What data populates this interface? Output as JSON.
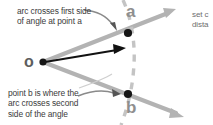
{
  "figure": {
    "vertex_label": "o",
    "point_a_label": "a",
    "point_b_label": "b",
    "callout_a": "arc crosses first side\nof angle at point a",
    "callout_b": "point b is where the\narc crosses second\nside of the angle",
    "callout_right": "set c\ndista"
  },
  "colors": {
    "ray": "#b3b3b3",
    "arc": "#c4c4c4",
    "point": "#1a1a1a",
    "radius_arrow": "#000000",
    "leader": "#8a8a8a",
    "text": "#3b3b3b",
    "label": "#8f8f8f",
    "background": "#ffffff"
  },
  "geometry": {
    "vertex": [
      43,
      62
    ],
    "point_a": [
      128,
      33
    ],
    "point_b": [
      128,
      94
    ],
    "ray_upper_end": [
      176,
      9
    ],
    "ray_lower_end": [
      184,
      117
    ],
    "radius_arrow_end": [
      125,
      48
    ],
    "arc_radius": 88
  }
}
